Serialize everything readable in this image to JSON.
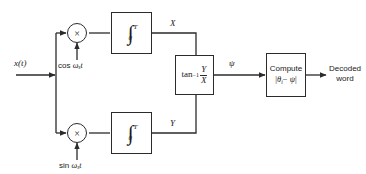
{
  "diagram": {
    "stroke_color": "#2b2b2b",
    "background_color": "#ffffff",
    "input": {
      "label": "x(t)"
    },
    "branches": {
      "upper": {
        "multiplier_symbol": "×",
        "carrier_prefix": "cos",
        "carrier_omega": "ω",
        "carrier_subscript": "s",
        "carrier_time": "t",
        "integrator_symbol": "∫",
        "integrator_upper_limit": "T",
        "integrator_lower_limit": "0",
        "output_label": "X"
      },
      "lower": {
        "multiplier_symbol": "×",
        "carrier_prefix": "sin",
        "carrier_omega": "ω",
        "carrier_subscript": "s",
        "carrier_time": "t",
        "integrator_symbol": "∫",
        "integrator_upper_limit": "T",
        "integrator_lower_limit": "0",
        "output_label": "Y"
      }
    },
    "arctan_block": {
      "function": "tan",
      "exponent": "−1",
      "numerator": "Y",
      "denominator": "X",
      "output_label": "ψ"
    },
    "compute_block": {
      "line1": "Compute",
      "line2_open": "|",
      "line2_theta": "θ",
      "line2_subscript": "i",
      "line2_minus": "−",
      "line2_psi": "ψ",
      "line2_close": "|"
    },
    "output": {
      "line1": "Decoded",
      "line2": "word"
    }
  }
}
